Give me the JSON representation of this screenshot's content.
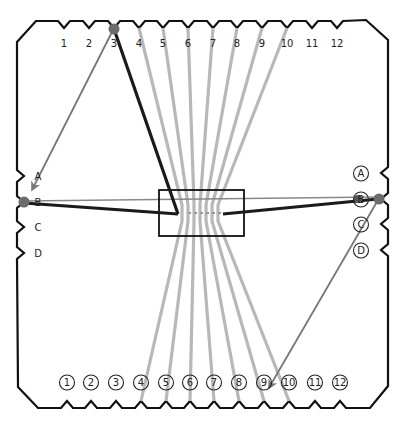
{
  "diagram": {
    "type": "loom-card-threading",
    "frame_color": "#111111",
    "string_color_light": "#b8b8b8",
    "string_color_dark": "#222222",
    "arrow_color": "#777777",
    "peg_color": "#6b6b6b"
  },
  "top_labels": [
    "1",
    "2",
    "3",
    "4",
    "5",
    "6",
    "7",
    "8",
    "9",
    "10",
    "11",
    "12"
  ],
  "bottom_labels": [
    "1",
    "2",
    "3",
    "4",
    "5",
    "6",
    "7",
    "8",
    "9",
    "10",
    "11",
    "12"
  ],
  "left_labels": [
    "A",
    "B",
    "C",
    "D"
  ],
  "right_labels": [
    "A",
    "B",
    "C",
    "D"
  ],
  "top_x": [
    64,
    89,
    114,
    139,
    163,
    188,
    213,
    237,
    262,
    287,
    312,
    337
  ],
  "bottom_x": [
    67,
    91,
    116,
    141,
    166,
    190,
    214,
    239,
    264,
    289,
    315,
    340
  ],
  "left_y": [
    176,
    202,
    227,
    253
  ],
  "right_y": [
    173,
    199,
    224,
    250
  ],
  "gray_strings": [
    {
      "from": "top-4",
      "to": "bottom-4"
    },
    {
      "from": "top-5",
      "to": "bottom-5"
    },
    {
      "from": "top-6",
      "to": "bottom-6"
    },
    {
      "from": "top-7",
      "to": "bottom-7"
    },
    {
      "from": "top-8",
      "to": "bottom-8"
    },
    {
      "from": "top-9",
      "to": "bottom-9"
    },
    {
      "from": "top-10",
      "to": "bottom-10"
    }
  ],
  "dark_strings": [
    {
      "from": "top-3",
      "to": "center-left"
    },
    {
      "from": "left-B",
      "to": "center-left"
    },
    {
      "from": "right-B",
      "to": "center-right"
    }
  ],
  "arrows": [
    {
      "from": "top-3",
      "to": "left-A"
    },
    {
      "from": "right-B",
      "to": "bottom-9"
    }
  ],
  "pegs": [
    "top-3",
    "left-B",
    "right-B"
  ],
  "center_box": {
    "x": 159,
    "y": 190,
    "w": 85,
    "h": 46
  }
}
